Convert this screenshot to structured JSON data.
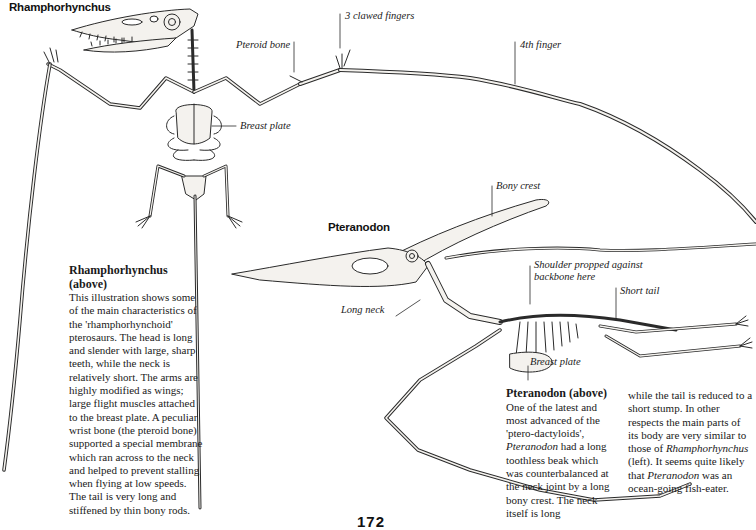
{
  "page": {
    "number": "172"
  },
  "rhamphorhynchus": {
    "title": "Rhamphorhynchus",
    "labels": {
      "clawed_fingers": "3 clawed fingers",
      "pteroid_bone": "Pteroid bone",
      "fourth_finger": "4th finger",
      "breast_plate": "Breast plate"
    },
    "caption": {
      "heading_line1": "Rhamphorhynchus",
      "heading_line2": "(above)",
      "body": "This illustration shows some of the main characteristics of the 'rhamphorhynchoid' pterosaurs. The head is long and slender with large, sharp teeth, while the neck is relatively short. The arms are highly modified as wings; large flight muscles attached to the breast plate. A peculiar wrist bone (the pteroid bone) supported a special membrane which ran across to the neck and helped to prevent stalling when flying at low speeds. The tail is very long and stiffened by thin bony rods."
    }
  },
  "pteranodon": {
    "title": "Pteranodon",
    "labels": {
      "bony_crest": "Bony crest",
      "shoulder_line1": "Shoulder propped against",
      "shoulder_line2": "backbone here",
      "short_tail": "Short tail",
      "long_neck": "Long neck",
      "breast_plate": "Breast plate"
    },
    "caption": {
      "heading": "Pteranodon (above)",
      "col1_a": "One of the latest and most advanced of the 'ptero-dactyloids', ",
      "col1_italic": "Pteranodon",
      "col1_b": " had a long toothless beak which was counterbalanced at the neck joint by a long bony crest. The neck itself is long",
      "col2_a": "while the tail is reduced to a short stump. In other respects the main parts of its body are very similar to those of ",
      "col2_italic1": "Rhamphorhynchus",
      "col2_b": " (left). It seems quite likely that ",
      "col2_italic2": "Pteranodon",
      "col2_c": " was an ocean-going fish-eater."
    }
  },
  "colors": {
    "ink": "#2a2a2a",
    "bone_fill": "#f4f2ee",
    "shade": "#d9d6d0"
  }
}
